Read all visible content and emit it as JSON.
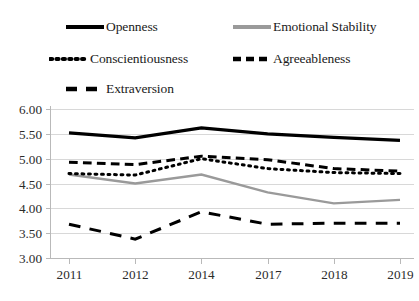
{
  "chart_data": {
    "type": "line",
    "title": "",
    "subtitle": "",
    "xlabel": "",
    "ylabel": "",
    "categories": [
      "2011",
      "2012",
      "2014",
      "2017",
      "2018",
      "2019"
    ],
    "ylim": [
      3.0,
      6.0
    ],
    "ytick_step": 0.5,
    "ytick_labels": [
      "6.00",
      "5.50",
      "5.00",
      "4.50",
      "4.00",
      "3.50",
      "3.00"
    ],
    "ytick_values": [
      6.0,
      5.5,
      5.0,
      4.5,
      4.0,
      3.5,
      3.0
    ],
    "grid": true,
    "grid_axis": "y",
    "legend_position": "top",
    "legend_columns": 2,
    "series": [
      {
        "name": "Openness",
        "style": "solid",
        "color": "#000000",
        "width": 3.2,
        "values": [
          5.52,
          5.42,
          5.62,
          5.5,
          5.43,
          5.37
        ]
      },
      {
        "name": "Emotional Stability",
        "style": "solid",
        "color": "#9a9a9a",
        "width": 2.4,
        "values": [
          4.68,
          4.5,
          4.68,
          4.32,
          4.1,
          4.17
        ]
      },
      {
        "name": "Conscientiousness",
        "style": "dotted",
        "color": "#000000",
        "width": 3.0,
        "values": [
          4.7,
          4.67,
          5.0,
          4.8,
          4.72,
          4.7
        ]
      },
      {
        "name": "Agreeableness",
        "style": "dashed",
        "color": "#000000",
        "width": 3.0,
        "values": [
          4.93,
          4.88,
          5.05,
          4.98,
          4.8,
          4.75
        ]
      },
      {
        "name": "Extraversion",
        "style": "longdash",
        "color": "#000000",
        "width": 3.0,
        "values": [
          3.68,
          3.38,
          3.93,
          3.68,
          3.7,
          3.7
        ]
      }
    ]
  },
  "legend": {
    "items": [
      {
        "label": "Openness",
        "key": "solid-thick-black-line-key"
      },
      {
        "label": "Emotional Stability",
        "key": "solid-gray-line-key"
      },
      {
        "label": "Conscientiousness",
        "key": "dotted-black-line-key"
      },
      {
        "label": "Agreeableness",
        "key": "dashed-black-line-key"
      },
      {
        "label": "Extraversion",
        "key": "long-dashed-black-line-key"
      }
    ]
  },
  "axes": {
    "y_labels": [
      "6.00",
      "5.50",
      "5.00",
      "4.50",
      "4.00",
      "3.50",
      "3.00"
    ],
    "x_labels": [
      "2011",
      "2012",
      "2014",
      "2017",
      "2018",
      "2019"
    ]
  }
}
